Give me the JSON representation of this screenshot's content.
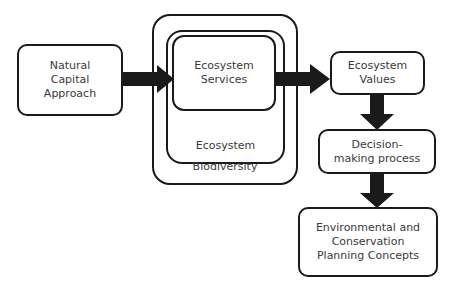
{
  "diagram": {
    "nodes": {
      "natural_capital": "Natural\nCapital\nApproach",
      "ecosystem_services": "Ecosystem\nServices",
      "ecosystem": "Ecosystem",
      "biodiversity": "Biodiversity",
      "ecosystem_values": "Ecosystem\nValues",
      "decision_making": "Decision-\nmaking process",
      "planning_concepts": "Environmental and\nConservation\nPlanning Concepts"
    },
    "edges": [
      {
        "from": "natural_capital",
        "to": "ecosystem_services"
      },
      {
        "from": "ecosystem_services",
        "to": "ecosystem_values"
      },
      {
        "from": "ecosystem_values",
        "to": "decision_making"
      },
      {
        "from": "decision_making",
        "to": "planning_concepts"
      }
    ],
    "colors": {
      "stroke": "#1a1a1a",
      "arrow": "#1a1a1a",
      "text": "#3a3a3a",
      "background": "#ffffff"
    }
  }
}
